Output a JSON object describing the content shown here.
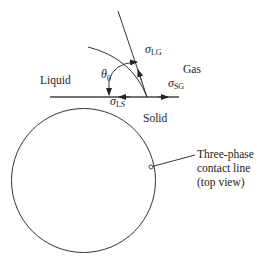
{
  "labels": {
    "liquid": "Liquid",
    "gas": "Gas",
    "solid": "Solid",
    "theta": "θ",
    "theta_sub": "0",
    "sigma": "σ",
    "sigma_lg_sub": "LG",
    "sigma_sg_sub": "SG",
    "sigma_ls_sub": "LS"
  },
  "callout": {
    "line1": "Three-phase",
    "line2": "contact line",
    "line3": "(top view)"
  }
}
